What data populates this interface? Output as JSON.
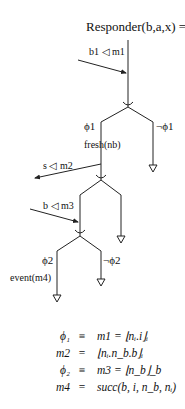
{
  "diagram": {
    "title": "Responder(b,a,x) =",
    "line_color": "#222222",
    "messages": [
      {
        "id": "m1",
        "label": "b1 ◁ m1",
        "direction": "incoming"
      },
      {
        "id": "m2",
        "label": "s ◁ m2",
        "direction": "outgoing"
      },
      {
        "id": "m3",
        "label": "b ◁ m3",
        "direction": "incoming"
      }
    ],
    "branches": [
      {
        "id": "branch1",
        "true_label": "ϕ1",
        "false_label": "¬ϕ1"
      },
      {
        "id": "branch2",
        "true_label": "",
        "false_label": ""
      },
      {
        "id": "branch3",
        "true_label": "ϕ2",
        "false_label": "¬ϕ2"
      }
    ],
    "actions": [
      {
        "id": "fresh",
        "label": "fresh(nb)"
      },
      {
        "id": "event",
        "label": "event(m4)"
      }
    ]
  },
  "definitions": [
    {
      "lhs": "ϕ₁",
      "op": "≡",
      "rhs": "m1 = ⌊nᵢ.i⌋ᵢ"
    },
    {
      "lhs": "m2",
      "op": "=",
      "rhs": "⌊nᵢ.n_b.b⌋ᵢ"
    },
    {
      "lhs": "ϕ₂",
      "op": "≡",
      "rhs": "m3 = ⌊n_b⌋_b"
    },
    {
      "lhs": "m4",
      "op": "=",
      "rhs": "succ(b, i, n_b, nᵢ)"
    }
  ]
}
